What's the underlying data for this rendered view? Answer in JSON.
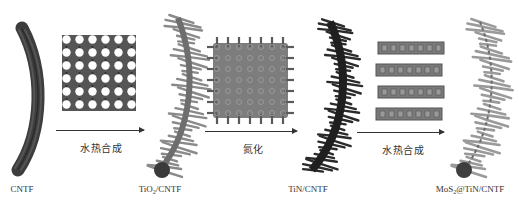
{
  "diagram": {
    "type": "synthesis-schematic",
    "colors": {
      "background": "#ffffff",
      "cntf": "#3d3d3d",
      "tio2": "#8a8a8a",
      "tin": "#2b2b2b",
      "mos2": "#9a9a9a",
      "arrow": "#333333"
    },
    "products": [
      {
        "id": "cntf",
        "label_main": "CNTF",
        "label_sub": "",
        "label_rest": ""
      },
      {
        "id": "tio2-cntf",
        "label_main": "TiO",
        "label_sub": "2",
        "label_rest": "/CNTF"
      },
      {
        "id": "tin-cntf",
        "label_main": "TiN/CNTF",
        "label_sub": "",
        "label_rest": ""
      },
      {
        "id": "mos2-tin-cntf",
        "label_main": "MoS",
        "label_sub": "2",
        "label_rest": "@TiN/CNTF"
      }
    ],
    "steps": [
      {
        "id": "step-1",
        "label": "水热合成",
        "crystal": "TiO2 lattice"
      },
      {
        "id": "step-2",
        "label": "氮化",
        "crystal": "TiN lattice"
      },
      {
        "id": "step-3",
        "label": "水热合成",
        "crystal": "MoS2 layers"
      }
    ]
  }
}
